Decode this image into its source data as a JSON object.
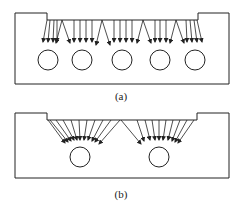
{
  "figure": {
    "panels": [
      {
        "id": "a",
        "caption": "(a)",
        "description": "Uniform vertical flow distribution from channel to five circles",
        "circles": [
          48,
          82,
          122,
          160,
          195
        ],
        "circle_y": 60
      },
      {
        "id": "b",
        "caption": "(b)",
        "description": "Converging flow toward two circles",
        "circles": [
          80,
          159
        ],
        "circle_y": 157
      }
    ],
    "colors": {
      "stroke": "#222222",
      "background": "#ffffff"
    }
  }
}
